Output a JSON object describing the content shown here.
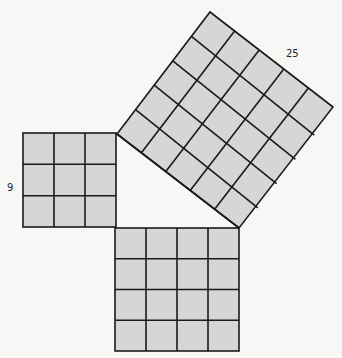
{
  "diagram": {
    "colors": {
      "background": "#f7f7f5",
      "fill": "#d6d6d4",
      "stroke": "#1a1a1a"
    },
    "squares": [
      {
        "id": "left",
        "label": "9",
        "side_units": 3
      },
      {
        "id": "bottom",
        "label": "",
        "side_units": 4
      },
      {
        "id": "hypotenuse",
        "label": "25",
        "side_units": 5
      }
    ],
    "labels": {
      "left": "9",
      "hypotenuse": "25"
    }
  }
}
